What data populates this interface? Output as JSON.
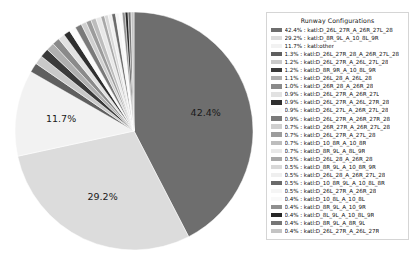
{
  "chart_data": {
    "type": "pie",
    "title": "Runway Configurations",
    "legend_position": "right",
    "value_unit": "percent",
    "displayed_labels": [
      "42.4%",
      "29.2%",
      "11.7%"
    ],
    "categories": [
      "katl:D_26L_27R_A_26R_27L_28",
      "katl:D_8R_9L_A_10_8L_9R",
      "katl:other",
      "katl:D_26L_27R_28_A_26R_27L_28",
      "katl:D_26L_27R_A_26L_27L_28",
      "katl:D_8R_9R_A_10_8L_9R",
      "katl:D_26L_28_A_26L_28",
      "katl:D_26R_28_A_26R_28",
      "katl:D_26L_27R_A_26R_27L",
      "katl:D_26L_27R_A_26L_27R_28",
      "katl:D_26L_27L_A_26R_27L_28",
      "katl:D_26L_27R_A_26R_27R_28",
      "katl:D_26R_27R_A_26R_27L_28",
      "katl:D_26L_27R_A_27L_28",
      "katl:D_10_8R_A_10_8R",
      "katl:D_8R_9L_A_8L_9R",
      "katl:D_26L_28_A_26R_28",
      "katl:D_8R_9L_A_10_8R_9R",
      "katl:D_26L_28_A_26R_27L_28",
      "katl:D_10_8R_9L_A_10_8L_8R",
      "katl:D_26L_27R_A_26R_28",
      "katl:D_10_8L_A_10_8L",
      "katl:D_8R_9L_A_10_9R",
      "katl:D_8L_9L_A_10_8L_9R",
      "katl:D_8R_9L_A_8R_9L",
      "katl:D_26L_27R_A_26L_27R"
    ],
    "values": [
      42.4,
      29.2,
      11.7,
      1.3,
      1.2,
      1.2,
      1.1,
      1.0,
      0.9,
      0.9,
      0.9,
      0.9,
      0.7,
      0.7,
      0.7,
      0.7,
      0.5,
      0.5,
      0.5,
      0.5,
      0.5,
      0.4,
      0.4,
      0.4,
      0.4,
      0.4
    ],
    "colors": [
      "#6e6e6e",
      "#dcdcdc",
      "#f2f2f2",
      "#5f5f5f",
      "#c9c9c9",
      "#3a3a3a",
      "#b0b0b0",
      "#8a8a8a",
      "#e2e2e2",
      "#2f2f2f",
      "#fafafa",
      "#7a7a7a",
      "#cfcfcf",
      "#9c9c9c",
      "#bdbdbd",
      "#e8e8e8",
      "#a8a8a8",
      "#d8d8d8",
      "#efefef",
      "#6a6a6a",
      "#f5f5f5",
      "#f9f9f9",
      "#8f8f8f",
      "#262626",
      "#767676",
      "#c4c4c4"
    ]
  },
  "legend": {
    "title": "Runway Configurations",
    "separator": " : ",
    "rows": [
      {
        "percent": "42.4%",
        "label": "katl:D_26L_27R_A_26R_27L_28"
      },
      {
        "percent": "29.2%",
        "label": "katl:D_8R_9L_A_10_8L_9R"
      },
      {
        "percent": "11.7%",
        "label": "katl:other"
      },
      {
        "percent": "1.3%",
        "label": "katl:D_26L_27R_28_A_26R_27L_28"
      },
      {
        "percent": "1.2%",
        "label": "katl:D_26L_27R_A_26L_27L_28"
      },
      {
        "percent": "1.2%",
        "label": "katl:D_8R_9R_A_10_8L_9R"
      },
      {
        "percent": "1.1%",
        "label": "katl:D_26L_28_A_26L_28"
      },
      {
        "percent": "1.0%",
        "label": "katl:D_26R_28_A_26R_28"
      },
      {
        "percent": "0.9%",
        "label": "katl:D_26L_27R_A_26R_27L"
      },
      {
        "percent": "0.9%",
        "label": "katl:D_26L_27R_A_26L_27R_28"
      },
      {
        "percent": "0.9%",
        "label": "katl:D_26L_27L_A_26R_27L_28"
      },
      {
        "percent": "0.9%",
        "label": "katl:D_26L_27R_A_26R_27R_28"
      },
      {
        "percent": "0.7%",
        "label": "katl:D_26R_27R_A_26R_27L_28"
      },
      {
        "percent": "0.7%",
        "label": "katl:D_26L_27R_A_27L_28"
      },
      {
        "percent": "0.7%",
        "label": "katl:D_10_8R_A_10_8R"
      },
      {
        "percent": "0.7%",
        "label": "katl:D_8R_9L_A_8L_9R"
      },
      {
        "percent": "0.5%",
        "label": "katl:D_26L_28_A_26R_28"
      },
      {
        "percent": "0.5%",
        "label": "katl:D_8R_9L_A_10_8R_9R"
      },
      {
        "percent": "0.5%",
        "label": "katl:D_26L_28_A_26R_27L_28"
      },
      {
        "percent": "0.5%",
        "label": "katl:D_10_8R_9L_A_10_8L_8R"
      },
      {
        "percent": "0.5%",
        "label": "katl:D_26L_27R_A_26R_28"
      },
      {
        "percent": "0.4%",
        "label": "katl:D_10_8L_A_10_8L"
      },
      {
        "percent": "0.4%",
        "label": "katl:D_8R_9L_A_10_9R"
      },
      {
        "percent": "0.4%",
        "label": "katl:D_8L_9L_A_10_8L_9R"
      },
      {
        "percent": "0.4%",
        "label": "katl:D_8R_9L_A_8R_9L"
      },
      {
        "percent": "0.4%",
        "label": "katl:D_26L_27R_A_26L_27R"
      }
    ]
  }
}
